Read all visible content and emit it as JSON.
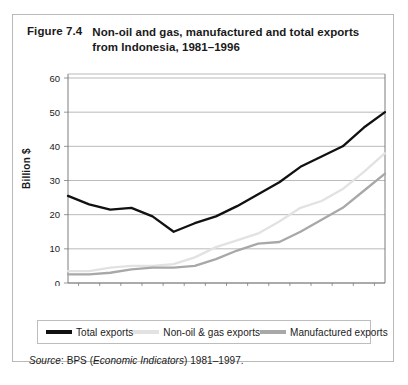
{
  "figure": {
    "number": "Figure 7.4",
    "title": "Non-oil and gas, manufactured and total exports from Indonesia, 1981–1996"
  },
  "source": {
    "prefix": "Source",
    "colon": ": BPS (",
    "italic": "Economic Indicators",
    "suffix": ") 1981–1997."
  },
  "legend": {
    "items": [
      {
        "label": "Total exports",
        "color": "#111111",
        "swatch": "line-swatch-total"
      },
      {
        "label": "Non-oil & gas exports",
        "color": "#e2e2e2",
        "swatch": "line-swatch-nonoil"
      },
      {
        "label": "Manufactured exports",
        "color": "#a8a8a8",
        "swatch": "line-swatch-manufactured"
      }
    ]
  },
  "chart_data": {
    "type": "line",
    "title": "Non-oil and gas, manufactured and total exports from Indonesia, 1981–1996",
    "xlabel": "",
    "ylabel": "Billion $",
    "ylim": [
      0,
      60
    ],
    "yticks": [
      0,
      10,
      20,
      30,
      40,
      50,
      60
    ],
    "grid": true,
    "legend_position": "bottom",
    "categories": [
      "1981",
      "1982",
      "1983",
      "1984",
      "1985",
      "1986",
      "1987",
      "1988",
      "1989",
      "1990",
      "1991",
      "1992",
      "1993",
      "1994",
      "1995",
      "1996"
    ],
    "series": [
      {
        "name": "Total exports",
        "color": "#111111",
        "values": [
          25.5,
          23.0,
          21.5,
          22.0,
          19.5,
          15.0,
          17.5,
          19.5,
          22.5,
          26.0,
          29.5,
          34.0,
          37.0,
          40.0,
          45.5,
          50.0
        ]
      },
      {
        "name": "Non-oil & gas exports",
        "color": "#e2e2e2",
        "values": [
          3.5,
          3.5,
          4.5,
          5.0,
          5.0,
          5.5,
          7.5,
          10.5,
          12.5,
          14.5,
          18.0,
          22.0,
          24.0,
          27.5,
          32.5,
          38.0
        ]
      },
      {
        "name": "Manufactured exports",
        "color": "#a8a8a8",
        "values": [
          2.5,
          2.5,
          3.0,
          4.0,
          4.5,
          4.5,
          5.0,
          7.0,
          9.5,
          11.5,
          12.0,
          15.0,
          18.5,
          22.0,
          27.0,
          32.0
        ]
      }
    ]
  }
}
